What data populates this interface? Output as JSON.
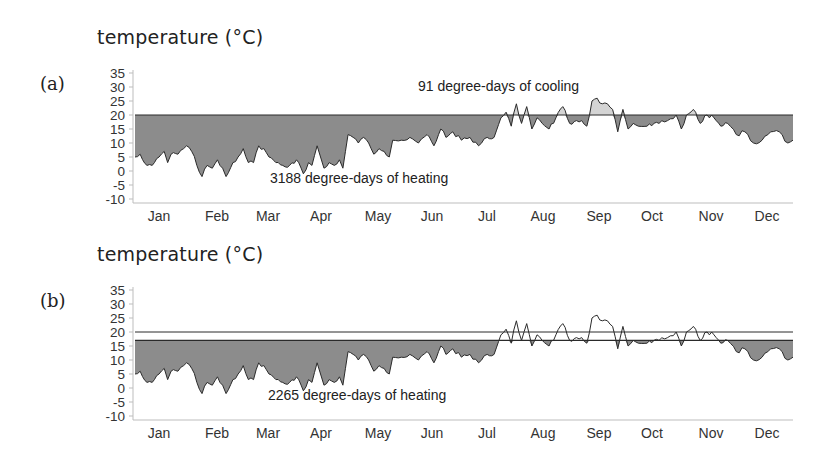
{
  "chart_data": [
    {
      "type": "area",
      "panel": "(a)",
      "title": "temperature (°C)",
      "ylabel": "temperature (°C)",
      "xlabel": "",
      "ylim": [
        -10,
        35
      ],
      "yticks": [
        35,
        30,
        25,
        20,
        15,
        10,
        5,
        0,
        -5,
        -10
      ],
      "categories": [
        "Jan",
        "Feb",
        "Mar",
        "Apr",
        "May",
        "Jun",
        "Jul",
        "Aug",
        "Sep",
        "Oct",
        "Nov",
        "Dec"
      ],
      "base_temperature": 20,
      "heating_threshold": 20,
      "grid": false,
      "annotations": [
        {
          "text": "91 degree-days of cooling",
          "near": "Jul",
          "position": "above 20°C line"
        },
        {
          "text": "3188 degree-days of heating",
          "near": "Mar-Apr",
          "position": "below series"
        }
      ],
      "series": [
        {
          "name": "daily mean temperature",
          "monthly_approx_values": [
            4,
            4,
            4,
            11,
            14,
            19,
            21,
            17,
            18,
            13,
            8,
            6
          ]
        }
      ],
      "degree_days_cooling": 91,
      "degree_days_heating": 3188
    },
    {
      "type": "area",
      "panel": "(b)",
      "title": "temperature (°C)",
      "ylabel": "temperature (°C)",
      "xlabel": "",
      "ylim": [
        -10,
        35
      ],
      "yticks": [
        35,
        30,
        25,
        20,
        15,
        10,
        5,
        0,
        -5,
        -10
      ],
      "categories": [
        "Jan",
        "Feb",
        "Mar",
        "Apr",
        "May",
        "Jun",
        "Jul",
        "Aug",
        "Sep",
        "Oct",
        "Nov",
        "Dec"
      ],
      "reference_line": 20,
      "heating_threshold": 17,
      "grid": false,
      "annotations": [
        {
          "text": "2265 degree-days of heating",
          "near": "Mar-Apr",
          "position": "below series"
        }
      ],
      "series": [
        {
          "name": "daily mean temperature",
          "monthly_approx_values": [
            4,
            4,
            4,
            11,
            14,
            19,
            21,
            17,
            18,
            13,
            8,
            6
          ]
        }
      ],
      "degree_days_heating": 2265
    }
  ],
  "panels": {
    "a": {
      "label": "(a)",
      "axis_title": "temperature (°C)",
      "annotation_cooling": "91 degree-days of cooling",
      "annotation_heating": "3188 degree-days of heating"
    },
    "b": {
      "label": "(b)",
      "axis_title": "temperature (°C)",
      "annotation_heating": "2265 degree-days of heating"
    }
  },
  "colors": {
    "heating_fill": "#8c8c8c",
    "cooling_fill": "#d4d4d4",
    "line": "#2a2a2a",
    "axis": "#bdbdbd"
  },
  "yticks": [
    "35",
    "30",
    "25",
    "20",
    "15",
    "10",
    "5",
    "0",
    "-5",
    "-10"
  ],
  "months": [
    "Jan",
    "Feb",
    "Mar",
    "Apr",
    "May",
    "Jun",
    "Jul",
    "Aug",
    "Sep",
    "Oct",
    "Nov",
    "Dec"
  ]
}
